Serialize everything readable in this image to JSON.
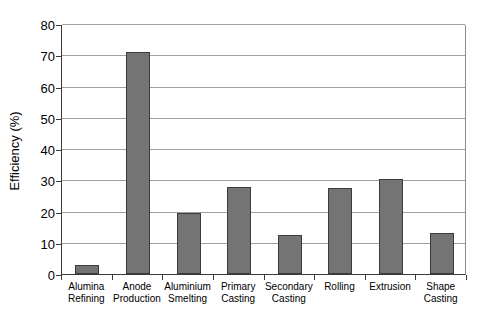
{
  "chart_data": {
    "type": "bar",
    "title": "",
    "xlabel": "",
    "ylabel": "Efficiency (%)",
    "categories": [
      "Alumina Refining",
      "Anode Production",
      "Aluminium Smelting",
      "Primary Casting",
      "Secondary Casting",
      "Rolling",
      "Extrusion",
      "Shape Casting"
    ],
    "values": [
      3,
      71,
      19.5,
      28,
      12.5,
      27.5,
      30.5,
      13
    ],
    "ylim": [
      0,
      80
    ],
    "ytick_step": 10,
    "grid": true,
    "legend_position": "none",
    "colors": {
      "bar_fill": "#747474",
      "bar_border": "#3b3b3b",
      "gridline": "#a0a0a0",
      "axis": "#3b3b3b",
      "background": "#ffffff",
      "text": "#000000"
    }
  }
}
